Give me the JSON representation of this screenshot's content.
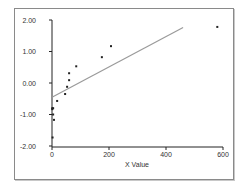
{
  "chart_data": {
    "type": "scatter",
    "title": "",
    "xlabel": "X Value",
    "ylabel": "",
    "xlim": [
      0,
      600
    ],
    "ylim": [
      -2.0,
      2.0
    ],
    "x_ticks": [
      "0",
      "200",
      "400",
      "600"
    ],
    "y_ticks": [
      "2.00",
      "1.00",
      "0.00",
      "-1.00",
      "-2.00"
    ],
    "grid": false,
    "legend": null,
    "series": [
      {
        "name": "observed",
        "type": "scatter",
        "x": [
          2,
          7,
          4,
          1,
          1,
          4,
          18,
          46,
          53,
          60,
          60,
          85,
          175,
          207,
          580
        ],
        "y": [
          -1.73,
          -1.17,
          -1.0,
          -0.83,
          -0.8,
          -0.8,
          -0.57,
          -0.35,
          -0.12,
          0.09,
          0.31,
          0.53,
          0.82,
          1.17,
          1.78
        ]
      },
      {
        "name": "fit line",
        "type": "line",
        "x": [
          0,
          460
        ],
        "y": [
          -0.45,
          1.76
        ]
      }
    ],
    "colors": {
      "points": "#222222",
      "fit_line": "#9a9a9a",
      "axis": "#222222",
      "frame": "#8a8a8a"
    }
  }
}
